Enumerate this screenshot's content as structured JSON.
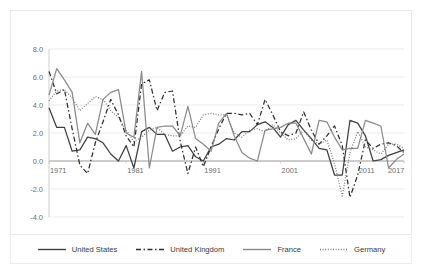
{
  "chart_data": {
    "type": "line",
    "title": "",
    "subtitle": "",
    "xlabel": "",
    "ylabel": "",
    "xlim": [
      1971,
      2017
    ],
    "ylim": [
      -4.0,
      8.0
    ],
    "grid": true,
    "legend_position": "bottom",
    "x": [
      1971,
      1972,
      1973,
      1974,
      1975,
      1976,
      1977,
      1978,
      1979,
      1980,
      1981,
      1982,
      1983,
      1984,
      1985,
      1986,
      1987,
      1988,
      1989,
      1990,
      1991,
      1992,
      1993,
      1994,
      1995,
      1996,
      1997,
      1998,
      1999,
      2000,
      2001,
      2002,
      2003,
      2004,
      2005,
      2006,
      2007,
      2008,
      2009,
      2010,
      2011,
      2012,
      2013,
      2014,
      2015,
      2016,
      2017
    ],
    "x_tick_labels": [
      "1971",
      "1981",
      "1991",
      "2001",
      "2011",
      "2017"
    ],
    "x_tick_values": [
      1971,
      1981,
      1991,
      2001,
      2011,
      2017
    ],
    "y_tick_labels": [
      "8.0",
      "6.0",
      "4.0",
      "2.0",
      "0.0",
      "-2.0",
      "-4.0"
    ],
    "y_tick_values": [
      8.0,
      6.0,
      4.0,
      2.0,
      0.0,
      -2.0,
      -4.0
    ],
    "series": [
      {
        "name": "United States",
        "style": "solid",
        "color": "#3f3f3f",
        "width": 1.25,
        "values": [
          3.8,
          2.4,
          2.4,
          0.7,
          0.8,
          1.7,
          1.6,
          1.3,
          0.5,
          0.0,
          1.1,
          -0.5,
          2.1,
          2.4,
          1.9,
          1.9,
          0.7,
          1.0,
          1.1,
          0.3,
          0.0,
          1.0,
          1.2,
          1.6,
          1.5,
          2.1,
          2.1,
          2.6,
          2.8,
          2.4,
          1.7,
          2.6,
          2.9,
          2.2,
          1.6,
          0.9,
          0.8,
          -1.0,
          -1.0,
          2.9,
          2.7,
          1.8,
          0.0,
          0.1,
          0.4,
          0.6,
          0.8
        ]
      },
      {
        "name": "United Kingdom",
        "style": "dashed",
        "color": "#2e2e2e",
        "width": 1.25,
        "values": [
          6.4,
          4.8,
          5.1,
          2.3,
          -0.3,
          -0.9,
          1.3,
          2.8,
          4.4,
          3.3,
          1.8,
          1.0,
          5.5,
          5.8,
          3.6,
          4.9,
          5.0,
          1.4,
          -0.9,
          1.0,
          -0.4,
          1.0,
          2.3,
          3.4,
          3.4,
          3.3,
          3.4,
          2.6,
          4.4,
          3.3,
          2.1,
          1.8,
          2.0,
          3.5,
          2.2,
          1.2,
          1.8,
          2.5,
          1.1,
          -2.6,
          -1.0,
          1.5,
          0.9,
          1.2,
          1.3,
          1.1,
          0.6
        ]
      },
      {
        "name": "France",
        "style": "solid",
        "color": "#8a8a8a",
        "width": 1.25,
        "values": [
          4.7,
          6.6,
          5.8,
          4.9,
          1.3,
          2.7,
          1.9,
          4.4,
          4.9,
          5.1,
          2.0,
          1.7,
          6.4,
          -0.5,
          2.4,
          2.5,
          2.5,
          1.8,
          3.9,
          1.6,
          1.2,
          0.7,
          2.7,
          3.4,
          1.8,
          0.6,
          0.2,
          0.0,
          2.2,
          2.3,
          2.4,
          2.7,
          2.7,
          1.6,
          0.5,
          2.9,
          2.8,
          1.7,
          0.8,
          0.9,
          0.9,
          2.9,
          2.7,
          2.5,
          -0.5,
          0.1,
          0.5
        ]
      },
      {
        "name": "Germany",
        "style": "dotted",
        "color": "#7a7a7a",
        "width": 1.25,
        "values": [
          4.3,
          5.0,
          5.1,
          4.5,
          3.6,
          4.1,
          4.6,
          4.4,
          3.6,
          3.1,
          2.2,
          1.4,
          1.7,
          2.2,
          2.4,
          1.9,
          1.8,
          1.8,
          2.5,
          2.4,
          3.3,
          3.4,
          3.3,
          3.3,
          2.0,
          1.7,
          2.2,
          2.3,
          2.1,
          2.6,
          2.0,
          1.5,
          1.6,
          2.2,
          1.5,
          1.2,
          1.5,
          -0.2,
          -2.5,
          0.6,
          2.1,
          1.0,
          0.8,
          0.5,
          1.2,
          1.2,
          0.9
        ]
      }
    ]
  },
  "legend": {
    "items": [
      {
        "label": "United States",
        "style": "solid",
        "color": "#3f3f3f"
      },
      {
        "label": "United Kingdom",
        "style": "dashed",
        "color": "#2e2e2e"
      },
      {
        "label": "France",
        "style": "solid",
        "color": "#8a8a8a"
      },
      {
        "label": "Germany",
        "style": "dotted",
        "color": "#7a7a7a"
      }
    ]
  }
}
